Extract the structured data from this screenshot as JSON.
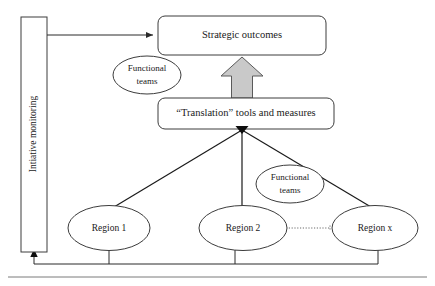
{
  "diagram": {
    "colors": {
      "stroke": "#3c3c3c",
      "connector": "#2b2b2b",
      "block_arrow_fill": "#c9c9c9",
      "block_arrow_stroke": "#5a5a5a",
      "text": "#1a1a1a",
      "background": "#ffffff",
      "dotted_connector": "#6a6a6a",
      "bottom_rule": "#7a7a7a"
    },
    "nodes": {
      "monitoring": {
        "label": "Intiative monitoring",
        "shape": "vertical-rectangle"
      },
      "strategic_outcomes": {
        "label": "Strategic outcomes",
        "shape": "rounded-rectangle"
      },
      "translation_tools": {
        "label": "“Translation” tools and measures",
        "shape": "rounded-rectangle"
      },
      "functional_teams_top": {
        "line1": "Functional",
        "line2": "teams",
        "shape": "ellipse"
      },
      "functional_teams_lower": {
        "line1": "Functional",
        "line2": "teams",
        "shape": "ellipse"
      },
      "region_1": {
        "label": "Region 1",
        "shape": "ellipse"
      },
      "region_2": {
        "label": "Region 2",
        "shape": "ellipse"
      },
      "region_x": {
        "label": "Region x",
        "shape": "ellipse"
      }
    },
    "connectors": [
      {
        "name": "monitoring-to-strategic-outcomes",
        "from": "monitoring",
        "to": "strategic_outcomes",
        "style": "solid",
        "arrowhead": "open"
      },
      {
        "name": "translation-to-strategic-outcomes",
        "from": "translation_tools",
        "to": "strategic_outcomes",
        "style": "block-arrow",
        "arrowhead": "block"
      },
      {
        "name": "region-1-to-translation",
        "from": "region_1",
        "to": "translation_tools",
        "style": "solid",
        "arrowhead": "filled"
      },
      {
        "name": "region-2-to-translation",
        "from": "region_2",
        "to": "translation_tools",
        "style": "solid",
        "arrowhead": "filled"
      },
      {
        "name": "region-x-to-translation",
        "from": "region_x",
        "to": "translation_tools",
        "style": "solid",
        "arrowhead": "filled"
      },
      {
        "name": "region-2-to-region-x",
        "from": "region_2",
        "to": "region_x",
        "style": "dotted",
        "arrowhead": "none"
      },
      {
        "name": "regions-feedback-to-monitoring",
        "from": "regions",
        "to": "monitoring",
        "style": "solid",
        "arrowhead": "filled"
      }
    ]
  }
}
